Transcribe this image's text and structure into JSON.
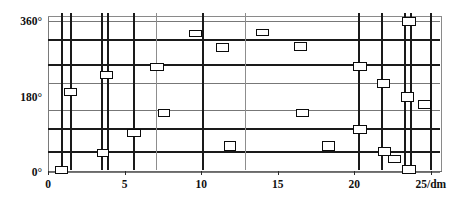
{
  "chart_data": {
    "type": "scatter",
    "title": "",
    "xlabel": "25/dm",
    "ylabel": "",
    "xlim": [
      0,
      25.6
    ],
    "ylim": [
      0,
      370
    ],
    "grid": true,
    "legend": "none",
    "x_ticks": [
      {
        "value": 0,
        "label": "0"
      },
      {
        "value": 5,
        "label": "5"
      },
      {
        "value": 10,
        "label": "10"
      },
      {
        "value": 15,
        "label": "15"
      },
      {
        "value": 20,
        "label": "20"
      },
      {
        "value": 25,
        "label": "25/dm"
      }
    ],
    "y_ticks": [
      {
        "value": 0,
        "label": "0°"
      },
      {
        "value": 180,
        "label": "180°"
      },
      {
        "value": 360,
        "label": "360°"
      }
    ],
    "gridlines_horizontal": [
      {
        "value": 360,
        "weight": "thin"
      },
      {
        "value": 315,
        "weight": "thick"
      },
      {
        "value": 255,
        "weight": "thick"
      },
      {
        "value": 212,
        "weight": "thin"
      },
      {
        "value": 148,
        "weight": "thin"
      },
      {
        "value": 103,
        "weight": "thick"
      },
      {
        "value": 48,
        "weight": "thick"
      },
      {
        "value": 0,
        "weight": "thin"
      }
    ],
    "gridlines_vertical": [
      {
        "value": 0.9,
        "weight": "thick"
      },
      {
        "value": 1.5,
        "weight": "thick"
      },
      {
        "value": 3.5,
        "weight": "thick"
      },
      {
        "value": 3.9,
        "weight": "thick"
      },
      {
        "value": 5.6,
        "weight": "thick"
      },
      {
        "value": 7.1,
        "weight": "thin"
      },
      {
        "value": 10.1,
        "weight": "thick"
      },
      {
        "value": 12.9,
        "weight": "thin"
      },
      {
        "value": 20.3,
        "weight": "thick"
      },
      {
        "value": 21.8,
        "weight": "thick"
      },
      {
        "value": 23.3,
        "weight": "thick"
      },
      {
        "value": 23.7,
        "weight": "thick"
      },
      {
        "value": 25.0,
        "weight": "thick"
      }
    ],
    "points": [
      {
        "x": 0.9,
        "y": 5,
        "w": 13,
        "h": 8
      },
      {
        "x": 1.5,
        "y": 190,
        "w": 13,
        "h": 8
      },
      {
        "x": 3.6,
        "y": 45,
        "w": 12,
        "h": 8
      },
      {
        "x": 3.8,
        "y": 232,
        "w": 13,
        "h": 8
      },
      {
        "x": 5.6,
        "y": 92,
        "w": 14,
        "h": 8
      },
      {
        "x": 7.1,
        "y": 250,
        "w": 14,
        "h": 8
      },
      {
        "x": 7.6,
        "y": 140,
        "w": 12,
        "h": 8
      },
      {
        "x": 9.6,
        "y": 330,
        "w": 13,
        "h": 7
      },
      {
        "x": 11.4,
        "y": 298,
        "w": 13,
        "h": 9
      },
      {
        "x": 11.9,
        "y": 62,
        "w": 12,
        "h": 10
      },
      {
        "x": 14.0,
        "y": 333,
        "w": 13,
        "h": 7
      },
      {
        "x": 16.5,
        "y": 300,
        "w": 13,
        "h": 9
      },
      {
        "x": 16.6,
        "y": 140,
        "w": 13,
        "h": 8
      },
      {
        "x": 18.3,
        "y": 62,
        "w": 13,
        "h": 10
      },
      {
        "x": 20.4,
        "y": 252,
        "w": 14,
        "h": 9
      },
      {
        "x": 20.4,
        "y": 102,
        "w": 14,
        "h": 9
      },
      {
        "x": 21.9,
        "y": 212,
        "w": 13,
        "h": 9
      },
      {
        "x": 22.0,
        "y": 48,
        "w": 13,
        "h": 9
      },
      {
        "x": 22.6,
        "y": 30,
        "w": 13,
        "h": 8
      },
      {
        "x": 23.5,
        "y": 180,
        "w": 13,
        "h": 10
      },
      {
        "x": 23.6,
        "y": 5,
        "w": 14,
        "h": 9
      },
      {
        "x": 23.6,
        "y": 360,
        "w": 14,
        "h": 9
      },
      {
        "x": 24.6,
        "y": 160,
        "w": 13,
        "h": 9
      }
    ]
  },
  "axis": {
    "x_unit_label": "25/dm",
    "y_top_label": "360°",
    "y_mid_label": "180°",
    "y_bottom_label": "0°"
  },
  "colors": {
    "line": "#1a1a1a",
    "axis": "#6a6a6a",
    "marker_stroke": "#0b0b0b",
    "marker_fill": "#ffffff",
    "background": "#ffffff"
  }
}
